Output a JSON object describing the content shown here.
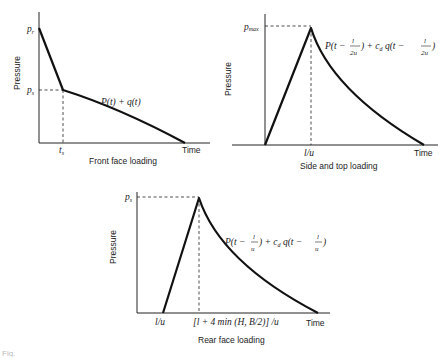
{
  "figure": {
    "panels": [
      {
        "id": "front",
        "caption": "Front face loading",
        "ylabel": "Pressure",
        "xlabel": "Time",
        "y_marks": [
          {
            "label": "p",
            "sub": "r"
          },
          {
            "label": "p",
            "sub": "s"
          }
        ],
        "x_marks": [
          {
            "label": "t",
            "sub": "s"
          }
        ],
        "curve_label": "P(t) + q(t)"
      },
      {
        "id": "side",
        "caption": "Side and top loading",
        "ylabel": "Pressure",
        "xlabel": "Time",
        "y_marks": [
          {
            "label": "p",
            "sub": "max"
          }
        ],
        "x_marks": [
          {
            "label": "l/u"
          }
        ],
        "curve_label": "P(t − l/2u) + c_d q(t − l/2u)",
        "curve_label_parts": {
          "a": "P(t −",
          "frac_num": "l",
          "frac_den": "2u",
          "b": ") + c",
          "sub": "d",
          "c": " q(t −",
          "d": ")"
        }
      },
      {
        "id": "rear",
        "caption": "Rear face loading",
        "ylabel": "Pressure",
        "xlabel": "Time",
        "y_marks": [
          {
            "label": "p",
            "sub": "s"
          }
        ],
        "x_marks": [
          {
            "label": "l/u"
          },
          {
            "label": "[l + 4 min (H, B/2)] /u"
          }
        ],
        "curve_label": "P(t − l/u) + c_d q(t − l/u)",
        "curve_label_parts": {
          "a": "P(t −",
          "frac_num": "l",
          "frac_den": "u",
          "b": ") + c",
          "sub": "d",
          "c": " q(t −",
          "d": ")"
        }
      }
    ],
    "footer_fragment": "Fig."
  }
}
